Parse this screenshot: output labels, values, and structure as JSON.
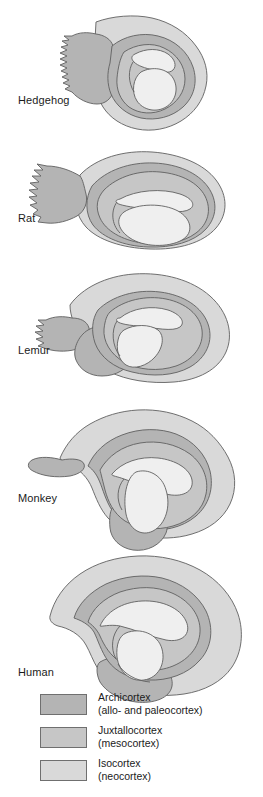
{
  "figure": {
    "type": "comparative-anatomy-diagram",
    "background_color": "#ffffff",
    "outline_color": "#5f5f5f"
  },
  "species": [
    {
      "id": "hedgehog",
      "label": "Hedgehog",
      "label_x": 18,
      "label_y": 94
    },
    {
      "id": "rat",
      "label": "Rat",
      "label_x": 18,
      "label_y": 212
    },
    {
      "id": "lemur",
      "label": "Lemur",
      "label_x": 18,
      "label_y": 344
    },
    {
      "id": "monkey",
      "label": "Monkey",
      "label_x": 18,
      "label_y": 492
    },
    {
      "id": "human",
      "label": "Human",
      "label_x": 18,
      "label_y": 666
    }
  ],
  "legend": {
    "items": [
      {
        "id": "archicortex",
        "name": "Archicortex",
        "sub": "(allo- and paleocortex)",
        "color": "#b4b4b4",
        "top": 0
      },
      {
        "id": "juxtallocortex",
        "name": "Juxtallocortex",
        "sub": "(mesocortex)",
        "color": "#c6c6c6",
        "top": 33
      },
      {
        "id": "isocortex",
        "name": "Isocortex",
        "sub": "(neocortex)",
        "color": "#d9d9d9",
        "top": 66
      }
    ]
  },
  "colors": {
    "archicortex": "#b4b4b4",
    "juxtallocortex": "#c6c6c6",
    "isocortex": "#d9d9d9",
    "ventricle": "#eeeeee",
    "stroke": "#606060",
    "text": "#1b1b1b"
  }
}
